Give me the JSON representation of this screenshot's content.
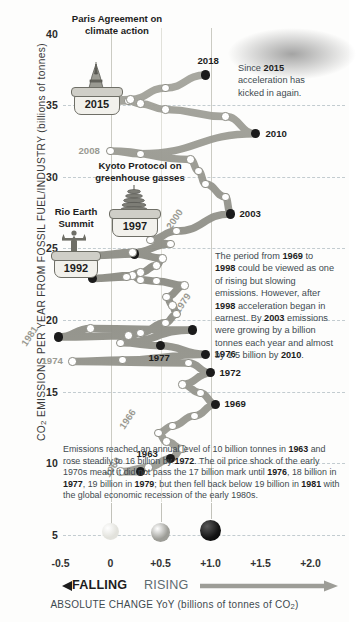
{
  "chart_data": {
    "type": "line",
    "title": "",
    "xlabel": "ABSOLUTE CHANGE YoY (billions of tonnes of CO2)",
    "ylabel": "CO2 EMISSIONS PER YEAR FROM FOSSIL FUEL/INDUSTRY (billions of tonnes)",
    "xlim": [
      -0.75,
      2.25
    ],
    "ylim": [
      3.5,
      41.5
    ],
    "grid": true,
    "legend_position": "bottom",
    "y_ticks": [
      "40",
      "35",
      "30",
      "25",
      "20",
      "15",
      "10",
      "5"
    ],
    "y_tick_values": [
      40,
      35,
      30,
      25,
      20,
      15,
      10,
      5
    ],
    "x_ticks": [
      "-0.5",
      "0",
      "+0.5",
      "+1.0",
      "+1.5",
      "+2.0"
    ],
    "x_tick_values": [
      -0.5,
      0,
      0.5,
      1.0,
      1.5,
      2.0
    ],
    "series_name": "Annual CO2 emissions vs year-on-year change",
    "points": [
      {
        "year": 1960,
        "y": 9.4,
        "x": 0.3,
        "label": "1960",
        "marker": "dark"
      },
      {
        "year": 1961,
        "y": 9.4,
        "x": 0.1,
        "label": "",
        "marker": "open"
      },
      {
        "year": 1962,
        "y": 9.7,
        "x": 0.38,
        "label": "",
        "marker": "open"
      },
      {
        "year": 1963,
        "y": 10.3,
        "x": 0.6,
        "label": "1963",
        "marker": "dark"
      },
      {
        "year": 1964,
        "y": 11.0,
        "x": 0.72,
        "label": "",
        "marker": "open"
      },
      {
        "year": 1965,
        "y": 11.5,
        "x": 0.56,
        "label": "",
        "marker": "open"
      },
      {
        "year": 1966,
        "y": 12.1,
        "x": 0.48,
        "label": "1966",
        "marker": "open"
      },
      {
        "year": 1967,
        "y": 12.6,
        "x": 0.62,
        "label": "",
        "marker": "open"
      },
      {
        "year": 1968,
        "y": 13.3,
        "x": 0.84,
        "label": "",
        "marker": "open"
      },
      {
        "year": 1969,
        "y": 14.1,
        "x": 1.05,
        "label": "1969",
        "marker": "dark"
      },
      {
        "year": 1970,
        "y": 14.9,
        "x": 0.9,
        "label": "",
        "marker": "open"
      },
      {
        "year": 1971,
        "y": 15.5,
        "x": 0.72,
        "label": "",
        "marker": "open"
      },
      {
        "year": 1972,
        "y": 16.3,
        "x": 1.0,
        "label": "1972",
        "marker": "dark"
      },
      {
        "year": 1973,
        "y": 17.0,
        "x": 0.78,
        "label": "",
        "marker": "open"
      },
      {
        "year": 1974,
        "y": 17.1,
        "x": -0.38,
        "label": "1974",
        "marker": "open"
      },
      {
        "year": 1975,
        "y": 17.2,
        "x": 0.12,
        "label": "",
        "marker": "open"
      },
      {
        "year": 1976,
        "y": 17.6,
        "x": 0.95,
        "label": "1976",
        "marker": "dark"
      },
      {
        "year": 1977,
        "y": 18.2,
        "x": 0.5,
        "label": "1977",
        "marker": "dark"
      },
      {
        "year": 1978,
        "y": 18.4,
        "x": 0.1,
        "label": "",
        "marker": "open"
      },
      {
        "year": 1979,
        "y": 19.3,
        "x": 0.82,
        "label": "1979",
        "marker": "dark"
      },
      {
        "year": 1980,
        "y": 19.4,
        "x": -0.2,
        "label": "",
        "marker": "open"
      },
      {
        "year": 1981,
        "y": 18.8,
        "x": -0.52,
        "label": "1981",
        "marker": "dark"
      },
      {
        "year": 1982,
        "y": 18.9,
        "x": 0.18,
        "label": "",
        "marker": "open"
      },
      {
        "year": 1983,
        "y": 19.1,
        "x": 0.3,
        "label": "",
        "marker": "open"
      },
      {
        "year": 1984,
        "y": 19.8,
        "x": 0.55,
        "label": "",
        "marker": "open"
      },
      {
        "year": 1985,
        "y": 20.4,
        "x": 0.66,
        "label": "",
        "marker": "open"
      },
      {
        "year": 1986,
        "y": 21.0,
        "x": 0.62,
        "label": "",
        "marker": "open"
      },
      {
        "year": 1987,
        "y": 21.6,
        "x": 0.56,
        "label": "",
        "marker": "open"
      },
      {
        "year": 1988,
        "y": 22.4,
        "x": 0.74,
        "label": "",
        "marker": "open"
      },
      {
        "year": 1989,
        "y": 22.7,
        "x": 0.46,
        "label": "",
        "marker": "open"
      },
      {
        "year": 1990,
        "y": 22.8,
        "x": 0.3,
        "label": "",
        "marker": "open"
      },
      {
        "year": 1991,
        "y": 23.1,
        "x": 0.22,
        "label": "",
        "marker": "open"
      },
      {
        "year": 1992,
        "y": 22.9,
        "x": -0.18,
        "label": "1992",
        "marker": "dark"
      },
      {
        "year": 1993,
        "y": 23.0,
        "x": 0.16,
        "label": "",
        "marker": "open"
      },
      {
        "year": 1994,
        "y": 23.3,
        "x": 0.3,
        "label": "",
        "marker": "open"
      },
      {
        "year": 1995,
        "y": 23.8,
        "x": 0.46,
        "label": "",
        "marker": "open"
      },
      {
        "year": 1996,
        "y": 24.3,
        "x": 0.52,
        "label": "",
        "marker": "open"
      },
      {
        "year": 1997,
        "y": 24.6,
        "x": 0.24,
        "label": "1997",
        "marker": "dark"
      },
      {
        "year": 1998,
        "y": 24.5,
        "x": -0.16,
        "label": "1998",
        "marker": "dark"
      },
      {
        "year": 1999,
        "y": 24.7,
        "x": 0.22,
        "label": "",
        "marker": "open"
      },
      {
        "year": 2000,
        "y": 25.3,
        "x": 0.6,
        "label": "2000",
        "marker": "open"
      },
      {
        "year": 2001,
        "y": 25.6,
        "x": 0.4,
        "label": "",
        "marker": "open"
      },
      {
        "year": 2002,
        "y": 26.2,
        "x": 0.66,
        "label": "",
        "marker": "open"
      },
      {
        "year": 2003,
        "y": 27.4,
        "x": 1.2,
        "label": "2003",
        "marker": "dark"
      },
      {
        "year": 2004,
        "y": 28.6,
        "x": 1.15,
        "label": "",
        "marker": "open"
      },
      {
        "year": 2005,
        "y": 29.5,
        "x": 0.95,
        "label": "",
        "marker": "open"
      },
      {
        "year": 2006,
        "y": 30.4,
        "x": 0.88,
        "label": "",
        "marker": "open"
      },
      {
        "year": 2007,
        "y": 31.2,
        "x": 0.8,
        "label": "",
        "marker": "open"
      },
      {
        "year": 2008,
        "y": 31.8,
        "x": 0.0,
        "label": "2008",
        "marker": "open"
      },
      {
        "year": 2009,
        "y": 31.6,
        "x": 0.3,
        "label": "",
        "marker": "open"
      },
      {
        "year": 2010,
        "y": 33.0,
        "x": 1.45,
        "label": "2010",
        "marker": "dark"
      },
      {
        "year": 2011,
        "y": 34.2,
        "x": 1.15,
        "label": "",
        "marker": "open"
      },
      {
        "year": 2012,
        "y": 34.7,
        "x": 0.55,
        "label": "",
        "marker": "open"
      },
      {
        "year": 2013,
        "y": 35.1,
        "x": 0.3,
        "label": "",
        "marker": "open"
      },
      {
        "year": 2014,
        "y": 35.3,
        "x": 0.18,
        "label": "",
        "marker": "open"
      },
      {
        "year": 2015,
        "y": 35.2,
        "x": -0.1,
        "label": "2015",
        "marker": "dark"
      },
      {
        "year": 2016,
        "y": 35.4,
        "x": 0.2,
        "label": "",
        "marker": "open"
      },
      {
        "year": 2017,
        "y": 36.2,
        "x": 0.55,
        "label": "",
        "marker": "open"
      },
      {
        "year": 2018,
        "y": 37.1,
        "x": 0.95,
        "label": "2018",
        "marker": "dark"
      }
    ],
    "legend": {
      "caption_left": "FALLING",
      "caption_right": "RISING",
      "swatches": [
        {
          "label": "0",
          "color": "#e2e2dc"
        },
        {
          "label": "+0.5",
          "color": "#9d9d97"
        },
        {
          "label": "+1.0",
          "color": "#141414"
        }
      ]
    }
  },
  "axis": {
    "y_title_main": "CO",
    "y_title_sub": "2",
    "y_title_rest": " EMISSIONS PER YEAR FROM FOSSIL FUEL/INDUSTRY (billions of tonnes)",
    "x_title_main": "ABSOLUTE CHANGE YoY (billions of tonnes of CO",
    "x_title_sub": "2",
    "x_title_tail": ")",
    "falling": "FALLING",
    "rising": "RISING"
  },
  "milestones": [
    {
      "id": "paris",
      "icon": "eiffel-tower-icon",
      "year": "2015",
      "heading_line1": "Paris Agreement on",
      "heading_line2": "climate action"
    },
    {
      "id": "kyoto",
      "icon": "pagoda-icon",
      "year": "1997",
      "heading_line1": "Kyoto Protocol on",
      "heading_line2": "greenhouse gasses"
    },
    {
      "id": "rio",
      "icon": "christ-redeemer-icon",
      "year": "1992",
      "heading_line1": "Rio Earth",
      "heading_line2": "Summit"
    }
  ],
  "notes": {
    "since2015": {
      "l1a": "Since ",
      "l1b": "2015",
      "l2": "acceleration has",
      "l3": "kicked in again."
    },
    "period": {
      "l1a": "The period from ",
      "l1b": "1969",
      "l1c": " to",
      "l2a": "1998",
      "l2b": " could be viewed as one",
      "l3": "of rising but slowing",
      "l4": "emissions. However, after",
      "l5a": "1998",
      "l5b": " acceleration began in",
      "l6a": "earnest. By ",
      "l6b": "2003",
      "l6c": " emissions",
      "l7": "were growing by a billion",
      "l8": "tonnes each year and almost",
      "l9a": "by 1.5 billion by ",
      "l9b": "2010",
      "l9c": "."
    }
  },
  "paragraph": {
    "p1": "Emissions reached an annual level of 10 billion tonnes in ",
    "b1": "1963",
    "p2": " and rose steadily to 16 billion by ",
    "b2": "1972",
    "p3": ". The oil price shock of the early 1970s meant it did not pass the 17 billion mark until ",
    "b3": "1976",
    "p4": ", 18 billion in ",
    "b4": "1977",
    "p5": ", 19 billion in ",
    "b5": "1979",
    "p6": "; but then fell back below 19 billion in ",
    "b6": "1981",
    "p7": " with the global economic recession of the early 1980s."
  },
  "colors": {
    "ribbon": "#8e8e86",
    "node_dark": "#1b1b1b",
    "node_open": "#ffffff",
    "grid": "#b9c4c9",
    "text": "#2b2b2b",
    "note_text": "#3d4a50",
    "gray_label": "#9a9a92"
  }
}
